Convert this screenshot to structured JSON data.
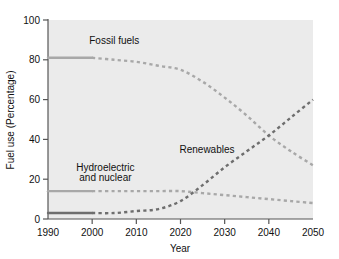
{
  "chart_data": {
    "type": "line",
    "title": "",
    "xlabel": "Year",
    "ylabel": "Fuel use (Percentage)",
    "xlim": [
      1990,
      2050
    ],
    "ylim": [
      0,
      100
    ],
    "xticks": [
      1990,
      2000,
      2010,
      2020,
      2030,
      2040,
      2050
    ],
    "xtick_labels": [
      "1990",
      "2000",
      "2010",
      "2020",
      "2030",
      "2040",
      "2050"
    ],
    "yticks": [
      0,
      20,
      40,
      60,
      80,
      100
    ],
    "ytick_labels": [
      "0",
      "20",
      "40",
      "60",
      "80",
      "100"
    ],
    "grid": false,
    "legend_position": "inline-annotations",
    "historical_end_year": 2000,
    "note": "Solid segments are historical (1990-2000); dashed segments are projections (2000-2050).",
    "series": [
      {
        "name": "Fossil fuels",
        "color": "#a8a8a8",
        "x": [
          1990,
          1995,
          2000,
          2005,
          2010,
          2015,
          2020,
          2025,
          2030,
          2035,
          2040,
          2045,
          2050
        ],
        "values": [
          81,
          81,
          81,
          80,
          79,
          77,
          75,
          69,
          61,
          52,
          42,
          34,
          27
        ]
      },
      {
        "name": "Hydroelectric and nuclear",
        "color": "#a8a8a8",
        "x": [
          1990,
          1995,
          2000,
          2005,
          2010,
          2015,
          2020,
          2025,
          2030,
          2035,
          2040,
          2045,
          2050
        ],
        "values": [
          14,
          14,
          14,
          14,
          14,
          14,
          14,
          13,
          12,
          11,
          10,
          9,
          8
        ]
      },
      {
        "name": "Renewables",
        "color": "#6e6e6e",
        "x": [
          1990,
          1995,
          2000,
          2005,
          2010,
          2015,
          2020,
          2025,
          2030,
          2035,
          2040,
          2045,
          2050
        ],
        "values": [
          3,
          3,
          3,
          3,
          4,
          5,
          9,
          17,
          26,
          34,
          42,
          51,
          60
        ]
      }
    ],
    "annotations": [
      {
        "text": "Fossil fuels",
        "x": 2005,
        "y": 88
      },
      {
        "text": "Hydroelectric",
        "x": 2003,
        "y": 24
      },
      {
        "text": "and nuclear",
        "x": 2003,
        "y": 19
      },
      {
        "text": "Renewables",
        "x": 2026,
        "y": 33
      }
    ]
  },
  "axes": {
    "y_title": "Fuel use (Percentage)",
    "x_title": "Year"
  },
  "labels": {
    "fossil": "Fossil fuels",
    "hydro_line1": "Hydroelectric",
    "hydro_line2": "and nuclear",
    "renewables": "Renewables"
  },
  "ticks": {
    "y": [
      "100",
      "80",
      "60",
      "40",
      "20",
      "0"
    ],
    "x": [
      "1990",
      "2000",
      "2010",
      "2020",
      "2030",
      "2040",
      "2050"
    ]
  },
  "colors": {
    "plot_background": "#ebebeb",
    "page_background": "#ffffff",
    "axis": "#555555",
    "light_series": "#a8a8a8",
    "dark_series": "#6e6e6e",
    "text": "#111111"
  }
}
